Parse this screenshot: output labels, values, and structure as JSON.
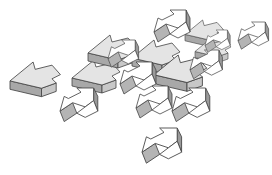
{
  "illustration": {
    "description": "Cluster of 3D isometric block arrows pointing left and up-right",
    "colors": {
      "background": "#ffffff",
      "outline": "#444444",
      "left_arrow_top": "#e4e4e4",
      "left_arrow_side": "#a8a8a8",
      "right_arrow_top": "#ffffff",
      "right_arrow_side": "#b4b4b4"
    },
    "arrow_count": 17
  }
}
